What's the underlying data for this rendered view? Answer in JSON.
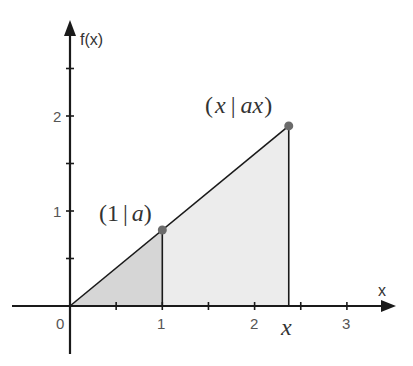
{
  "chart_data": {
    "type": "area",
    "title": "",
    "xlabel": "x",
    "ylabel": "f(x)",
    "xlim": [
      -0.5,
      3.5
    ],
    "ylim": [
      -0.5,
      3.0
    ],
    "grid": false,
    "function": "f(x) = a·x",
    "a": 0.8,
    "x_marker": 2.37,
    "x_ticks": [
      0,
      0.5,
      1,
      1.5,
      2,
      2.5,
      3
    ],
    "x_tick_labels": [
      {
        "value": 0,
        "label": "0"
      },
      {
        "value": 1,
        "label": "1"
      },
      {
        "value": 2,
        "label": "2"
      },
      {
        "value": 3,
        "label": "3"
      }
    ],
    "y_ticks": [
      0.5,
      1,
      1.5,
      2,
      2.5
    ],
    "y_tick_labels": [
      {
        "value": 1,
        "label": "1"
      },
      {
        "value": 2,
        "label": "2"
      }
    ],
    "line": {
      "x": [
        0,
        2.37
      ],
      "y": [
        0,
        1.9
      ]
    },
    "points": [
      {
        "x": 1,
        "y": 0.8,
        "label": "(1 | a)"
      },
      {
        "x": 2.37,
        "y": 1.9,
        "label": "(x | ax)"
      }
    ],
    "shaded_regions": [
      {
        "name": "triangle 0 to 1",
        "x_from": 0,
        "x_to": 1,
        "color": "#d6d6d6"
      },
      {
        "name": "region 1 to x",
        "x_from": 1,
        "x_to": 2.37,
        "color": "#ececec"
      }
    ],
    "annotations": [
      {
        "text": "x",
        "at_x": 2.37,
        "position": "below x-axis",
        "style": "italic serif"
      }
    ]
  },
  "labels": {
    "y_axis": "f(x)",
    "x_axis": "x",
    "origin": "0",
    "x1": "1",
    "x2": "2",
    "x3": "3",
    "y1": "1",
    "y2": "2",
    "point1_open": "(1",
    "point1_bar": "|",
    "point1_var": "a",
    "point1_close": ")",
    "point2_open": "(",
    "point2_x": "x",
    "point2_bar": "|",
    "point2_ax": "ax",
    "point2_close": ")",
    "x_marker": "x"
  },
  "colors": {
    "axis": "#1a1a1a",
    "fill_dark": "#d6d6d6",
    "fill_light": "#ececec",
    "point": "#6b6b6b"
  }
}
